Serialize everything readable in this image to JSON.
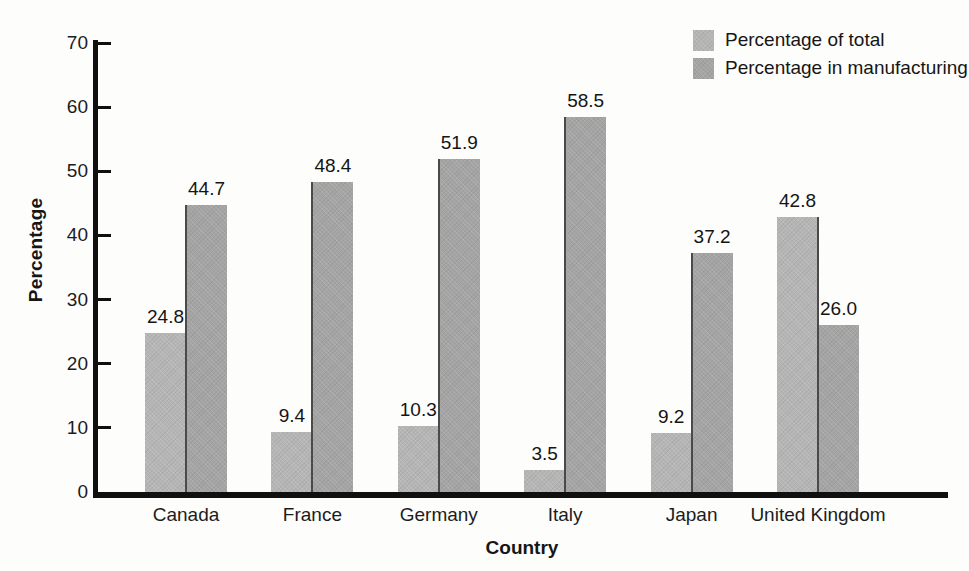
{
  "chart_data": {
    "type": "bar",
    "title": "",
    "categories": [
      "Canada",
      "France",
      "Germany",
      "Italy",
      "Japan",
      "United Kingdom"
    ],
    "series": [
      {
        "name": "Percentage of total",
        "color": "#b5b5b5",
        "values": [
          24.8,
          9.4,
          10.3,
          3.5,
          9.2,
          42.8
        ]
      },
      {
        "name": "Percentage in manufacturing",
        "color": "#a4a4a4",
        "values": [
          44.7,
          48.4,
          51.9,
          58.5,
          37.2,
          26.0
        ]
      }
    ],
    "xlabel": "Country",
    "ylabel": "Percentage",
    "ylim": [
      0,
      70
    ],
    "ytick_step": 10,
    "yticks": [
      0,
      10,
      20,
      30,
      40,
      50,
      60,
      70
    ],
    "grid": false,
    "legend_position": "top-right",
    "bar_labels": true,
    "bar_label_decimals": 1,
    "axis_color": "#101010",
    "divider_color": "#4a4a4a"
  }
}
